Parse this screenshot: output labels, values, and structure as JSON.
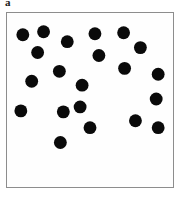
{
  "figure": {
    "panel_label": "a",
    "label_color": "#1a1a1a",
    "background_color": "#ffffff",
    "border_color": "#8d8d8d",
    "plot_background": "#fefefe"
  },
  "chart_data": {
    "type": "scatter",
    "title": "a",
    "xlabel": "",
    "ylabel": "",
    "grid": false,
    "legend": null,
    "axis_ticks": [],
    "marker": {
      "shape": "circle",
      "color": "#0a0a0a",
      "radius_px": 6.5,
      "count": 21
    },
    "xlim": [
      0,
      168
    ],
    "ylim": [
      0,
      176
    ],
    "points": [
      {
        "x": 16,
        "y": 22
      },
      {
        "x": 37,
        "y": 19
      },
      {
        "x": 61,
        "y": 29
      },
      {
        "x": 89,
        "y": 21
      },
      {
        "x": 118,
        "y": 20
      },
      {
        "x": 31,
        "y": 40
      },
      {
        "x": 93,
        "y": 43
      },
      {
        "x": 135,
        "y": 35
      },
      {
        "x": 25,
        "y": 69
      },
      {
        "x": 53,
        "y": 59
      },
      {
        "x": 119,
        "y": 56
      },
      {
        "x": 153,
        "y": 62
      },
      {
        "x": 76,
        "y": 73
      },
      {
        "x": 74,
        "y": 95
      },
      {
        "x": 151,
        "y": 87
      },
      {
        "x": 57,
        "y": 100
      },
      {
        "x": 14,
        "y": 99
      },
      {
        "x": 130,
        "y": 109
      },
      {
        "x": 84,
        "y": 116
      },
      {
        "x": 153,
        "y": 116
      },
      {
        "x": 54,
        "y": 131
      }
    ]
  }
}
